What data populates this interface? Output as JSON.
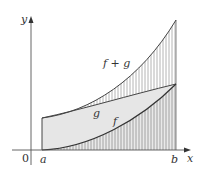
{
  "figure": {
    "type": "area-between-curves diagram",
    "axes": {
      "x_label": "x",
      "y_label": "y",
      "origin_label": "0",
      "interval_start_label": "a",
      "interval_end_label": "b"
    },
    "curves": [
      {
        "name": "f+g",
        "label": "f + g",
        "description": "upper curve, sum of f and g"
      },
      {
        "name": "g",
        "label": "g",
        "description": "nearly linear increasing curve"
      },
      {
        "name": "f",
        "label": "f",
        "description": "convex increasing curve starting at x-axis"
      }
    ],
    "regions": [
      {
        "name": "area-between-fg-and-g",
        "fill": "vertical hatching",
        "between": [
          "g",
          "f+g"
        ]
      },
      {
        "name": "area-between-g-and-f",
        "fill": "light gray solid",
        "between": [
          "f",
          "g"
        ]
      },
      {
        "name": "area-under-f",
        "fill": "vertical hatching",
        "between": [
          "x-axis",
          "f"
        ]
      }
    ],
    "colors": {
      "axis": "#555555",
      "curve": "#444444",
      "hatch": "#999999",
      "shade": "#e6e6e6",
      "text": "#333333"
    }
  }
}
